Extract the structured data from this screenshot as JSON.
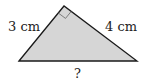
{
  "diagram": {
    "type": "right-triangle",
    "fill_color": "#d6d6d6",
    "stroke_color": "#1a1a1a",
    "vertices": {
      "left": [
        19,
        61
      ],
      "apex": [
        64,
        6
      ],
      "right": [
        137,
        61
      ]
    },
    "labels": {
      "left_side": "3 cm",
      "right_side": "4 cm",
      "base": "?"
    },
    "right_angle_marker": "apex"
  }
}
